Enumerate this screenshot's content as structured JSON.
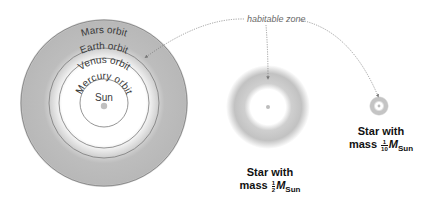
{
  "diagram": {
    "annotation": {
      "label": "habitable zone",
      "style": "dotted arrows pointing to each habitable zone"
    },
    "solar_system": {
      "center_label": "Sun",
      "orbits": [
        {
          "name": "Mercury",
          "label": "Mercury orbit"
        },
        {
          "name": "Venus",
          "label": "Venus orbit"
        },
        {
          "name": "Earth",
          "label": "Earth orbit"
        },
        {
          "name": "Mars",
          "label": "Mars orbit"
        }
      ]
    },
    "stars": [
      {
        "id": "half-mass",
        "caption_line1": "Star with",
        "caption_line2_prefix": "mass",
        "fraction_num": "1",
        "fraction_den": "2",
        "mass_symbol": "M",
        "mass_subscript": "Sun"
      },
      {
        "id": "tenth-mass",
        "caption_line1": "Star with",
        "caption_line2_prefix": "mass",
        "fraction_num": "1",
        "fraction_den": "10",
        "mass_symbol": "M",
        "mass_subscript": "Sun"
      }
    ],
    "colors": {
      "habitable_zone": "#b4b4b4",
      "orbit_line": "#7a7a7a",
      "star_dot": "#c0c0c0",
      "arrow": "#777777"
    }
  }
}
